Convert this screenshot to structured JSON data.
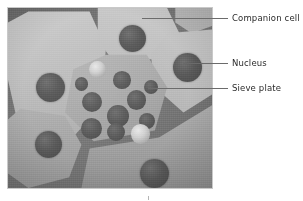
{
  "figure": {
    "kind": "micrograph-diagram",
    "panel": {
      "x": 8,
      "y": 8,
      "width": 204,
      "height": 180
    },
    "palette": {
      "cell_wall": "#757575",
      "cell_interior_light": "#c4c4c4",
      "cell_interior_dark": "#8e8e8e",
      "nucleus": "#535353",
      "pore": "#545454",
      "droplet_highlight": "#e8e8e8",
      "leader_line": "#6b6b6b",
      "label_text": "#2b2b2b",
      "page_background": "#ffffff"
    }
  },
  "annotations": [
    {
      "id": "companion-cell",
      "label": "Companion cell",
      "label_x": 232,
      "label_y": 13,
      "leader": {
        "x1": 142,
        "y1": 18,
        "x2": 228,
        "y2": 18
      }
    },
    {
      "id": "nucleus",
      "label": "Nucleus",
      "label_x": 232,
      "label_y": 58,
      "leader": {
        "x1": 183,
        "y1": 63,
        "x2": 228,
        "y2": 63
      }
    },
    {
      "id": "sieve-plate",
      "label": "Sieve plate",
      "label_x": 232,
      "label_y": 83,
      "leader": {
        "x1": 148,
        "y1": 88,
        "x2": 228,
        "y2": 88
      }
    }
  ],
  "cells": [
    {
      "id": "companion-cell-top-left",
      "role": "companion cell",
      "points": "10% 2%, 40% 2%, 48% 22%, 46% 54%, 30% 74%, 6% 70%, 0% 40%, 0% 8%",
      "shade_from": "#d0d0d0",
      "shade_to": "#9a9a9a",
      "shade_angle": 160
    },
    {
      "id": "companion-cell-top-mid",
      "role": "companion cell",
      "points": "44% 0%, 78% 0%, 84% 14%, 74% 28%, 52% 30%, 44% 18%",
      "shade_from": "#cdcdcd",
      "shade_to": "#9d9d9d",
      "shade_angle": 190
    },
    {
      "id": "companion-cell-top-right",
      "role": "companion cell",
      "points": "82% 0%, 100% 0%, 100% 10%, 90% 14%, 82% 8%",
      "shade_from": "#bdbdbd",
      "shade_to": "#8f8f8f",
      "shade_angle": 200
    },
    {
      "id": "companion-cell-right",
      "role": "companion cell",
      "points": "78% 14%, 100% 12%, 100% 48%, 86% 58%, 72% 44%, 70% 26%",
      "shade_from": "#cfcfcf",
      "shade_to": "#949494",
      "shade_angle": 210
    },
    {
      "id": "sieve-element-centre",
      "role": "sieve element showing sieve plate",
      "points": "48% 26%, 68% 26%, 78% 44%, 72% 68%, 42% 74%, 28% 58%, 32% 34%",
      "shade_from": "#c6c6c6",
      "shade_to": "#8c8c8c",
      "shade_angle": 155
    },
    {
      "id": "companion-cell-bottom-left",
      "role": "companion cell",
      "points": "6% 56%, 28% 60%, 36% 76%, 30% 94%, 10% 100%, 0% 92%, 0% 62%",
      "shade_from": "#cccccc",
      "shade_to": "#939393",
      "shade_angle": 170
    },
    {
      "id": "companion-cell-bottom-right",
      "role": "companion cell",
      "points": "40% 78%, 74% 72%, 100% 54%, 100% 100%, 36% 100%",
      "shade_from": "#cbcbcb",
      "shade_to": "#909090",
      "shade_angle": 185
    }
  ],
  "nuclei": [
    {
      "id": "nucleus-top-left",
      "cx": 21,
      "cy": 44,
      "r": 7.5
    },
    {
      "id": "nucleus-top-mid",
      "cx": 61,
      "cy": 17,
      "r": 7.0
    },
    {
      "id": "nucleus-right",
      "cx": 88,
      "cy": 33,
      "r": 7.5
    },
    {
      "id": "nucleus-bottom-left",
      "cx": 20,
      "cy": 76,
      "r": 7.0
    },
    {
      "id": "nucleus-bottom-right",
      "cx": 72,
      "cy": 92,
      "r": 7.5
    }
  ],
  "sieve_pores": [
    {
      "id": "pore-1",
      "cx": 41,
      "cy": 52,
      "r": 5.2
    },
    {
      "id": "pore-2",
      "cx": 56,
      "cy": 40,
      "r": 4.6
    },
    {
      "id": "pore-3",
      "cx": 63,
      "cy": 51,
      "r": 5.2
    },
    {
      "id": "pore-4",
      "cx": 54,
      "cy": 60,
      "r": 5.6
    },
    {
      "id": "pore-5",
      "cx": 41,
      "cy": 67,
      "r": 5.6
    },
    {
      "id": "pore-6",
      "cx": 53,
      "cy": 69,
      "r": 4.8
    },
    {
      "id": "pore-7",
      "cx": 68,
      "cy": 63,
      "r": 4.2
    },
    {
      "id": "pore-8",
      "cx": 70,
      "cy": 44,
      "r": 3.8
    },
    {
      "id": "pore-9",
      "cx": 36,
      "cy": 42,
      "r": 3.6
    }
  ],
  "droplets": [
    {
      "id": "droplet-upper",
      "cx": 44,
      "cy": 34,
      "r": 4.4
    },
    {
      "id": "droplet-lower",
      "cx": 65,
      "cy": 70,
      "r": 5.0
    }
  ],
  "scale_tick": {
    "x": 148,
    "y": 196
  }
}
